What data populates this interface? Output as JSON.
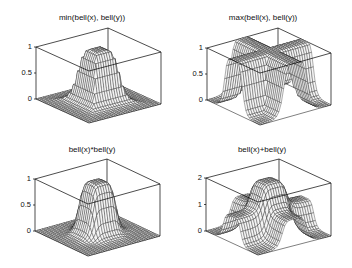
{
  "figure": {
    "width": 352,
    "height": 268,
    "background": "#ffffff",
    "line_color": "#000000",
    "surface_fill": "#f4f4f4"
  },
  "chart_data": [
    {
      "type": "surface",
      "title": "min(bell(x), bell(y))",
      "z_function": "min",
      "zlim": [
        0,
        1
      ],
      "zticks": [
        {
          "value": 0,
          "label": "0"
        },
        {
          "value": 0.5,
          "label": "0.5"
        },
        {
          "value": 1,
          "label": "1"
        }
      ],
      "grid": false,
      "box": {
        "top_left": [
          36,
          47
        ],
        "top_back": [
          107,
          29
        ],
        "top_right": [
          161,
          53
        ],
        "floor_left": [
          36,
          99
        ],
        "floor_front": [
          89,
          123
        ],
        "floor_right": [
          161,
          104
        ]
      },
      "title_pos": [
        92,
        13
      ]
    },
    {
      "type": "surface",
      "title": "max(bell(x), bell(y))",
      "z_function": "max",
      "zlim": [
        0,
        1
      ],
      "zticks": [
        {
          "value": 0,
          "label": "0"
        },
        {
          "value": 0.5,
          "label": "0.5"
        },
        {
          "value": 1,
          "label": "1"
        }
      ],
      "grid": false,
      "box": {
        "top_left": [
          207,
          48
        ],
        "top_back": [
          277,
          30
        ],
        "top_right": [
          331,
          52
        ],
        "floor_left": [
          207,
          100
        ],
        "floor_front": [
          260,
          125
        ],
        "floor_right": [
          331,
          105
        ]
      },
      "title_pos": [
        263,
        13
      ]
    },
    {
      "type": "surface",
      "title": "bell(x)*bell(y)",
      "z_function": "product",
      "zlim": [
        0,
        1
      ],
      "zticks": [
        {
          "value": 0,
          "label": "0"
        },
        {
          "value": 0.5,
          "label": "0.5"
        },
        {
          "value": 1,
          "label": "1"
        }
      ],
      "grid": false,
      "box": {
        "top_left": [
          35,
          179
        ],
        "top_back": [
          106,
          161
        ],
        "top_right": [
          160,
          184
        ],
        "floor_left": [
          35,
          231
        ],
        "floor_front": [
          88,
          256
        ],
        "floor_right": [
          160,
          236
        ]
      },
      "title_pos": [
        92,
        145
      ]
    },
    {
      "type": "surface",
      "title": "bell(x)+bell(y)",
      "z_function": "sum",
      "zlim": [
        0,
        2
      ],
      "zticks": [
        {
          "value": 0,
          "label": "0"
        },
        {
          "value": 1,
          "label": "1"
        },
        {
          "value": 2,
          "label": "2"
        }
      ],
      "grid": false,
      "box": {
        "top_left": [
          206,
          178
        ],
        "top_back": [
          276,
          160
        ],
        "top_right": [
          331,
          183
        ],
        "floor_left": [
          206,
          231
        ],
        "floor_front": [
          258,
          255
        ],
        "floor_right": [
          331,
          236
        ]
      },
      "title_pos": [
        262,
        145
      ]
    }
  ],
  "bell": {
    "a": 0.35,
    "b": 3,
    "c": 0,
    "domain": [
      -1,
      1
    ],
    "mesh_n": 30
  }
}
